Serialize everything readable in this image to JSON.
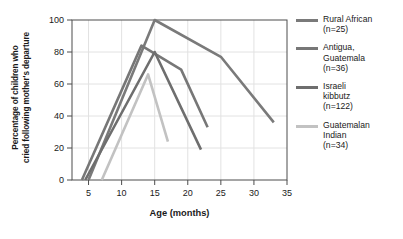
{
  "chart_data": {
    "type": "line",
    "title": "",
    "xlabel": "Age (months)",
    "ylabel": "Percentage of children who cried following mother's departure",
    "ylabel_line1": "Percentage of children who",
    "ylabel_line2": "cried following mother's departure",
    "xlim": [
      2.5,
      35
    ],
    "ylim": [
      0,
      100
    ],
    "xticks": [
      5,
      10,
      15,
      20,
      25,
      30,
      35
    ],
    "yticks": [
      0,
      20,
      40,
      60,
      80,
      100
    ],
    "grid": true,
    "legend_position": "right",
    "series": [
      {
        "name": "Rural African",
        "n": 25,
        "label_line1": "Rural African",
        "label_line2": "(n=25)",
        "color": "#7a7a7a",
        "x": [
          5,
          15,
          25,
          33
        ],
        "y": [
          0,
          100,
          77,
          36
        ]
      },
      {
        "name": "Antigua, Guatemala",
        "n": 36,
        "label_line1": "Antigua,",
        "label_line2": "Guatemala",
        "label_line3": "(n=36)",
        "color": "#777777",
        "x": [
          4,
          13,
          19,
          23
        ],
        "y": [
          0,
          84,
          69,
          33
        ]
      },
      {
        "name": "Israeli kibbutz",
        "n": 122,
        "label_line1": "Israeli",
        "label_line2": "kibbutz",
        "label_line3": "(n=122)",
        "color": "#6e6e6e",
        "x": [
          4.5,
          15,
          22
        ],
        "y": [
          0,
          80,
          19
        ]
      },
      {
        "name": "Guatemalan Indian",
        "n": 34,
        "label_line1": "Guatemalan",
        "label_line2": "Indian",
        "label_line3": "(n=34)",
        "color": "#c2c2c2",
        "x": [
          7,
          14,
          17
        ],
        "y": [
          0,
          66,
          24
        ]
      }
    ]
  },
  "axis": {
    "x_title": "Age (months)",
    "xticks": [
      "5",
      "10",
      "15",
      "20",
      "25",
      "30",
      "35"
    ],
    "yticks": [
      "0",
      "20",
      "40",
      "60",
      "80",
      "100"
    ]
  },
  "legend": {
    "items": [
      {
        "line1": "Rural African",
        "line2": "(n=25)",
        "line3": "",
        "color": "#7a7a7a"
      },
      {
        "line1": "Antigua,",
        "line2": "Guatemala",
        "line3": "(n=36)",
        "color": "#777777"
      },
      {
        "line1": "Israeli",
        "line2": "kibbutz",
        "line3": "(n=122)",
        "color": "#6e6e6e"
      },
      {
        "line1": "Guatemalan",
        "line2": "Indian",
        "line3": "(n=34)",
        "color": "#c2c2c2"
      }
    ]
  }
}
